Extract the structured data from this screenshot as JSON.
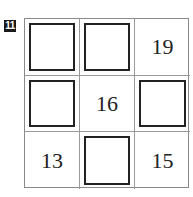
{
  "problem_number": "11",
  "grid": {
    "rows": 3,
    "cols": 3,
    "cells": [
      {
        "row": 1,
        "col": 1,
        "type": "blank-box",
        "value": ""
      },
      {
        "row": 1,
        "col": 2,
        "type": "blank-box",
        "value": ""
      },
      {
        "row": 1,
        "col": 3,
        "type": "number",
        "value": "19"
      },
      {
        "row": 2,
        "col": 1,
        "type": "blank-box",
        "value": ""
      },
      {
        "row": 2,
        "col": 2,
        "type": "number",
        "value": "16"
      },
      {
        "row": 2,
        "col": 3,
        "type": "blank-box",
        "value": ""
      },
      {
        "row": 3,
        "col": 1,
        "type": "number",
        "value": "13"
      },
      {
        "row": 3,
        "col": 2,
        "type": "blank-box",
        "value": ""
      },
      {
        "row": 3,
        "col": 3,
        "type": "number",
        "value": "15"
      }
    ]
  }
}
